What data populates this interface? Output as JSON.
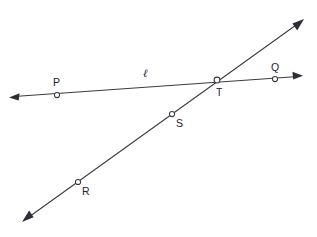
{
  "diagram": {
    "type": "geometry-line-diagram",
    "canvas": {
      "width": 317,
      "height": 237,
      "background": "#ffffff"
    },
    "stroke_color": "#3a3a42",
    "label_color": "#23232a",
    "line_label": "ℓ",
    "lines": [
      {
        "name": "line-l",
        "label": "ℓ",
        "label_pos": {
          "x": 145,
          "y": 77
        },
        "start": {
          "x": 9,
          "y": 97
        },
        "end": {
          "x": 303,
          "y": 76
        },
        "arrow_start": true,
        "arrow_end": true
      },
      {
        "name": "line-rst",
        "label": "",
        "start": {
          "x": 22,
          "y": 222
        },
        "end": {
          "x": 304,
          "y": 19
        },
        "arrow_start": true,
        "arrow_end": true
      }
    ],
    "points": [
      {
        "id": "P",
        "label": "P",
        "cx": 57,
        "cy": 95,
        "r": 2.6,
        "label_x": 53,
        "label_y": 86
      },
      {
        "id": "Q",
        "label": "Q",
        "cx": 275,
        "cy": 79,
        "r": 2.6,
        "label_x": 271,
        "label_y": 71
      },
      {
        "id": "T",
        "label": "T",
        "cx": 217,
        "cy": 80,
        "r": 2.9,
        "label_x": 216,
        "label_y": 96
      },
      {
        "id": "S",
        "label": "S",
        "cx": 172,
        "cy": 114,
        "r": 2.6,
        "label_x": 176,
        "label_y": 127
      },
      {
        "id": "R",
        "label": "R",
        "cx": 78,
        "cy": 182,
        "r": 2.6,
        "label_x": 82,
        "label_y": 195
      }
    ]
  }
}
